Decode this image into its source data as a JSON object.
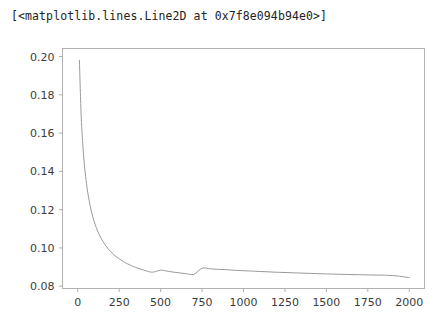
{
  "output": {
    "repr_text": "[<matplotlib.lines.Line2D at 0x7f8e094b94e0>]"
  },
  "figure": {
    "background": "#ffffff",
    "spine_color": "#b0b0b0",
    "tick_color": "#b0b0b0",
    "label_color": "#3b3b3b",
    "line_color": "#9a9a9a"
  },
  "chart_data": {
    "type": "line",
    "title": "",
    "xlabel": "",
    "ylabel": "",
    "xlim": [
      -92,
      2092
    ],
    "ylim": [
      0.0788,
      0.2042
    ],
    "xticks": [
      0,
      250,
      500,
      750,
      1000,
      1250,
      1500,
      1750,
      2000
    ],
    "xticklabels": [
      "0",
      "250",
      "500",
      "750",
      "1000",
      "1250",
      "1500",
      "1750",
      "2000"
    ],
    "yticks": [
      0.08,
      0.1,
      0.12,
      0.14,
      0.16,
      0.18,
      0.2
    ],
    "yticklabels": [
      "0.08",
      "0.10",
      "0.12",
      "0.14",
      "0.16",
      "0.18",
      "0.20"
    ],
    "grid": false,
    "legend": null,
    "linewidth": 1.0,
    "series": [
      {
        "name": "Line2D",
        "color": "#9a9a9a",
        "x": [
          10,
          20,
          30,
          40,
          50,
          60,
          70,
          80,
          90,
          100,
          120,
          140,
          160,
          180,
          200,
          225,
          250,
          275,
          300,
          350,
          400,
          450,
          500,
          550,
          600,
          650,
          700,
          750,
          800,
          850,
          900,
          950,
          1000,
          1100,
          1200,
          1300,
          1400,
          1500,
          1600,
          1700,
          1800,
          1900,
          2000
        ],
        "y": [
          0.198,
          0.1705,
          0.1545,
          0.1435,
          0.1355,
          0.1292,
          0.1242,
          0.12,
          0.1165,
          0.1135,
          0.1088,
          0.1052,
          0.1023,
          0.0999,
          0.098,
          0.0959,
          0.0943,
          0.0929,
          0.0917,
          0.0898,
          0.0884,
          0.0873,
          0.0884,
          0.0877,
          0.0871,
          0.0866,
          0.0862,
          0.0894,
          0.0891,
          0.0888,
          0.0886,
          0.0883,
          0.0881,
          0.0877,
          0.0873,
          0.087,
          0.0867,
          0.0864,
          0.0862,
          0.086,
          0.0858,
          0.0856,
          0.0845
        ]
      }
    ]
  }
}
